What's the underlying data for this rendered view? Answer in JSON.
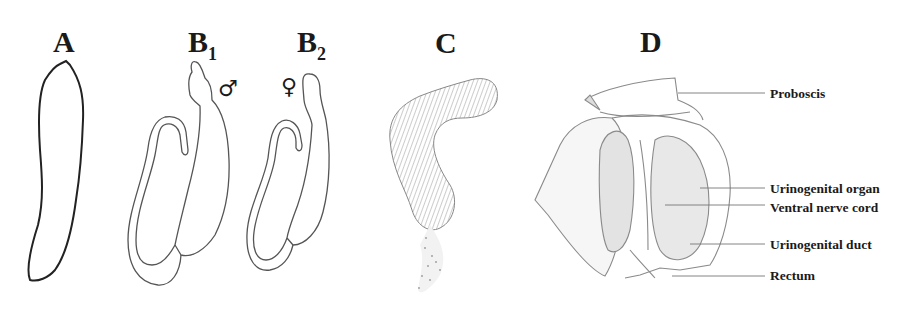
{
  "figure": {
    "panels": [
      {
        "id": "A",
        "label": "A",
        "subscript": ""
      },
      {
        "id": "B1",
        "label": "B",
        "subscript": "1",
        "sex_symbol": "♂"
      },
      {
        "id": "B2",
        "label": "B",
        "subscript": "2",
        "sex_symbol": "♀"
      },
      {
        "id": "C",
        "label": "C",
        "subscript": ""
      },
      {
        "id": "D",
        "label": "D",
        "subscript": ""
      }
    ],
    "annotations_D": [
      {
        "text": "Proboscis"
      },
      {
        "text": "Urinogenital organ"
      },
      {
        "text": "Ventral nerve cord"
      },
      {
        "text": "Urinogenital duct"
      },
      {
        "text": "Rectum"
      }
    ],
    "colors": {
      "ink": "#1a1a1a",
      "outline": "#555555",
      "stipple": "#8a8a8a",
      "background": "#ffffff"
    }
  }
}
